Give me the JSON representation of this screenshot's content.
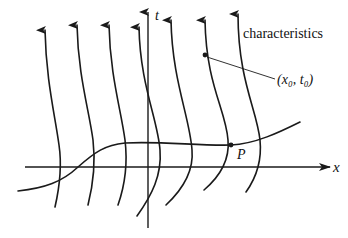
{
  "figure": {
    "labels": {
      "t_axis": "t",
      "x_axis": "x",
      "characteristics": "characteristics",
      "point_p": "P",
      "point_x0t0": "(x₀, t₀)"
    },
    "colors": {
      "ink": "#1a1a1a",
      "background": "#ffffff"
    },
    "elements": {
      "characteristic_count": 7,
      "initial_curve": "curve crossing the x-axis, intersecting characteristics at P",
      "marked_points": [
        "P",
        "(x₀, t₀)"
      ]
    }
  }
}
